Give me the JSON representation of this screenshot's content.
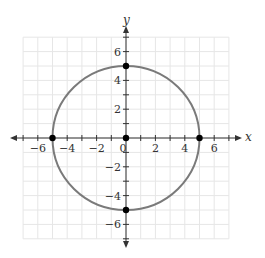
{
  "chart_data": {
    "type": "line",
    "title": "",
    "xlabel": "x",
    "ylabel": "y",
    "xlim": [
      -7,
      7
    ],
    "ylim": [
      -7,
      7
    ],
    "grid": true,
    "x_ticks": [
      -6,
      -4,
      -2,
      0,
      2,
      4,
      6
    ],
    "y_ticks": [
      -6,
      -4,
      -2,
      2,
      4,
      6
    ],
    "x_tick_labels": [
      "−6",
      "−4",
      "−2",
      "0",
      "2",
      "4",
      "6"
    ],
    "y_tick_labels": [
      "6",
      "4",
      "2",
      "−2",
      "−4",
      "−6"
    ],
    "series": [
      {
        "name": "circle",
        "shape": "circle",
        "center": [
          0,
          0
        ],
        "radius": 5,
        "color": "#7a7a7a"
      }
    ],
    "points": [
      {
        "x": 0,
        "y": 5
      },
      {
        "x": -5,
        "y": 0
      },
      {
        "x": 0,
        "y": 0
      },
      {
        "x": 5,
        "y": 0
      },
      {
        "x": 0,
        "y": -5
      }
    ],
    "colors": {
      "grid": "#e6e6e6",
      "axis": "#333333",
      "curve": "#7a7a7a",
      "point": "#000000"
    }
  }
}
